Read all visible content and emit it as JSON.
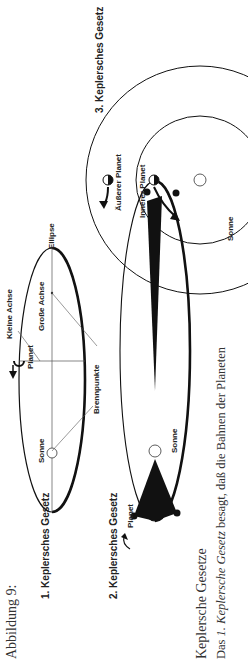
{
  "figure": {
    "caption": "Abbildung 9:",
    "law1": {
      "title": "1. Keplersches Gesetz",
      "labels": {
        "kleine_achse": "Kleine Achse",
        "grosse_achse": "Große Achse",
        "ellipse": "Ellipse",
        "planet": "Planet",
        "sonne": "Sonne",
        "brennpunkte": "Brennpunkte"
      }
    },
    "law2": {
      "title": "2. Keplersches Gesetz",
      "labels": {
        "planet": "Planet",
        "sonne": "Sonne"
      }
    },
    "law3": {
      "title": "3. Keplersches Gesetz",
      "labels": {
        "aeusserer_planet": "Äußerer Planet",
        "innerer_planet": "Innerer Planet",
        "sonne": "Sonne"
      }
    }
  },
  "text": {
    "heading": "Keplersche Gesetze",
    "line1_prefix": "Das ",
    "line1_italic": "1. Keplersche Gesetz",
    "line1_suffix": " besagt, daß die Bahnen der Planeten"
  }
}
